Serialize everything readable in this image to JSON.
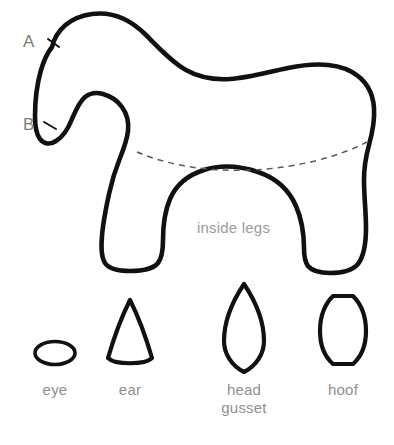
{
  "diagram": {
    "type": "sewing-pattern",
    "background_color": "#ffffff",
    "outline_color": "#111111",
    "label_color": "#8f8f8f",
    "seam_line_color": "#5a5a5a"
  },
  "body_piece": {
    "region_label": "inside legs",
    "notches": [
      {
        "id": "A",
        "label": "A"
      },
      {
        "id": "B",
        "label": "B"
      }
    ],
    "seam_line_style": "dashed"
  },
  "small_pieces": [
    {
      "id": "eye",
      "label": "eye",
      "shape": "ellipse"
    },
    {
      "id": "ear",
      "label": "ear",
      "shape": "triangle-curved-base"
    },
    {
      "id": "head-gusset",
      "label_line1": "head",
      "label_line2": "gusset",
      "shape": "pointed-lens"
    },
    {
      "id": "hoof",
      "label": "hoof",
      "shape": "rounded-hexagon"
    }
  ]
}
